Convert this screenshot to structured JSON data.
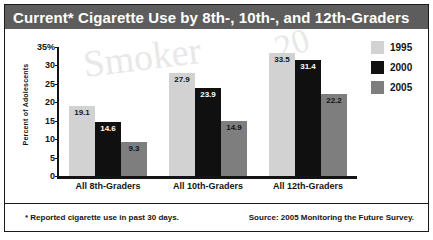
{
  "title": "Current* Cigarette Use by 8th-, 10th-, and 12th-Graders",
  "watermark": {
    "word": "Smoker",
    "fragment": "20",
    "blob": ")"
  },
  "footnote": "* Reported cigarette use in past 30 days.",
  "source": "Source: 2005 Monitoring the Future Survey.",
  "colors": {
    "title_bar": "#5d5d5d",
    "series_1995": "#d2d2d2",
    "series_2000": "#101010",
    "series_2005": "#7e7e7e",
    "axis": "#141414"
  },
  "legend": {
    "position": "top-right",
    "entries": [
      {
        "label": "1995",
        "color": "#d2d2d2"
      },
      {
        "label": "2000",
        "color": "#101010"
      },
      {
        "label": "2005",
        "color": "#7e7e7e"
      }
    ]
  },
  "yaxis": {
    "label": "Percent of Adolescents",
    "ticks": [
      "35%",
      "30",
      "25",
      "20",
      "15",
      "10",
      "5",
      "0"
    ]
  },
  "chart_data": {
    "type": "bar",
    "title": "Current* Cigarette Use by 8th-, 10th-, and 12th-Graders",
    "xlabel": "",
    "ylabel": "Percent of Adolescents",
    "ylim": [
      0,
      35
    ],
    "ytick_values": [
      0,
      5,
      10,
      15,
      20,
      25,
      30,
      35
    ],
    "grid": false,
    "legend_position": "top-right",
    "categories": [
      "All 8th-Graders",
      "All 10th-Graders",
      "All 12th-Graders"
    ],
    "series": [
      {
        "name": "1995",
        "color": "#d2d2d2",
        "values": [
          19.1,
          27.9,
          33.5
        ]
      },
      {
        "name": "2000",
        "color": "#101010",
        "values": [
          14.6,
          23.9,
          31.4
        ]
      },
      {
        "name": "2005",
        "color": "#7e7e7e",
        "values": [
          9.3,
          14.9,
          22.2
        ]
      }
    ],
    "annotations": [
      "* Reported cigarette use in past 30 days.",
      "Source: 2005 Monitoring the Future Survey."
    ]
  }
}
